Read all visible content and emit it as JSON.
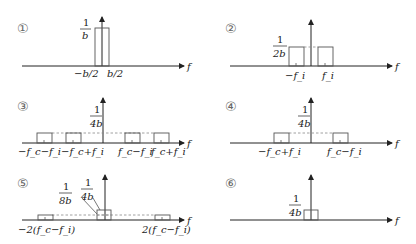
{
  "panels": [
    {
      "id": "1",
      "marker": "①",
      "axis_label": "f",
      "height_label": {
        "num": "1",
        "den": "b"
      },
      "ticks": [
        "−b/2",
        "b/2"
      ]
    },
    {
      "id": "2",
      "marker": "②",
      "axis_label": "f",
      "height_label": {
        "num": "1",
        "den": "2b"
      },
      "ticks": [
        "−f_i",
        "f_i"
      ]
    },
    {
      "id": "3",
      "marker": "③",
      "axis_label": "f",
      "height_label": {
        "num": "1",
        "den": "4b"
      },
      "ticks": [
        "−f_c−f_i",
        "−f_c+f_i",
        "f_c−f_i",
        "f_c+f_i"
      ]
    },
    {
      "id": "4",
      "marker": "④",
      "axis_label": "f",
      "height_label": {
        "num": "1",
        "den": "4b"
      },
      "ticks": [
        "−f_c+f_i",
        "f_c−f_i"
      ]
    },
    {
      "id": "5",
      "marker": "⑤",
      "axis_label": "f",
      "height_label": {
        "num": "1",
        "den": "4b"
      },
      "side_label": {
        "num": "1",
        "den": "8b"
      },
      "ticks": [
        "−2(f_c−f_i)",
        "2(f_c−f_i)"
      ]
    },
    {
      "id": "6",
      "marker": "⑥",
      "axis_label": "f",
      "height_label": {
        "num": "1",
        "den": "4b"
      },
      "ticks": []
    }
  ]
}
